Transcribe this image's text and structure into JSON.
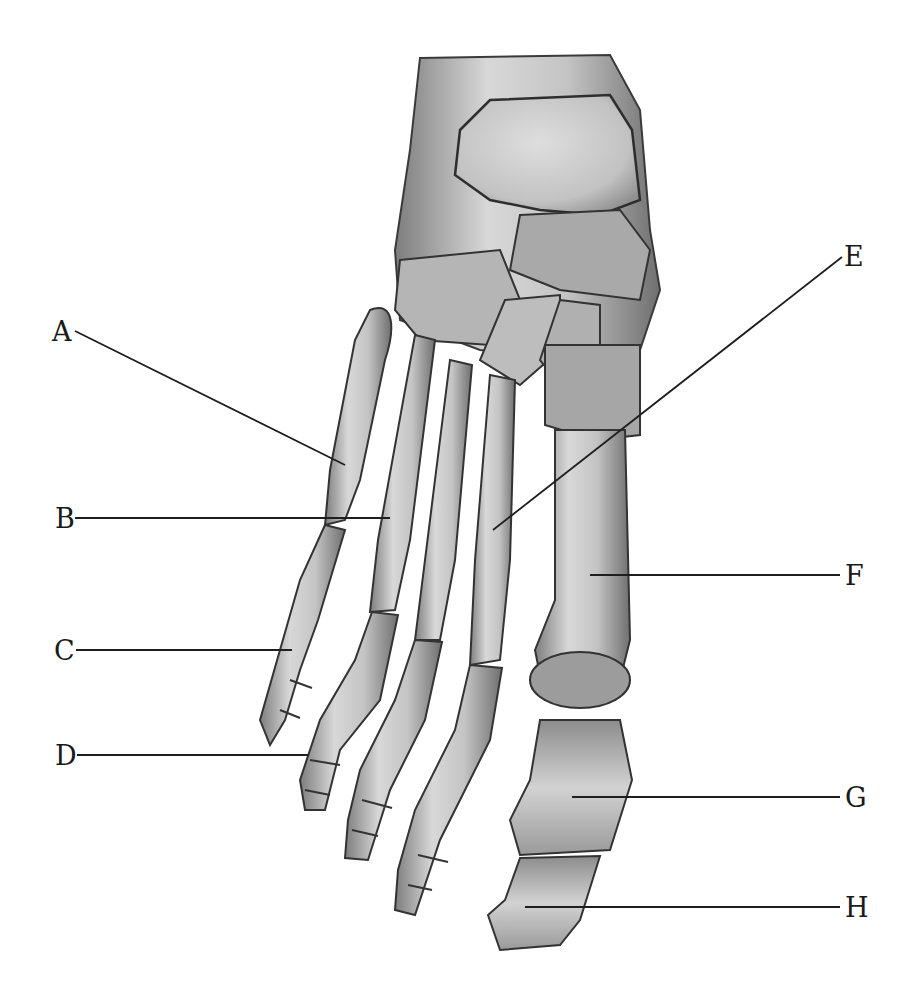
{
  "diagram": {
    "background_color": "#ffffff",
    "bone_color": "#c9c9c9",
    "bone_shade_color": "#8a8a8a",
    "outline_color": "#3a3a3a",
    "leader_line_color": "#1e1e1e",
    "labels": [
      {
        "id": "A",
        "text": "A",
        "x": 52,
        "y": 320,
        "line": [
          75,
          331,
          345,
          465
        ]
      },
      {
        "id": "B",
        "text": "B",
        "x": 55,
        "y": 506,
        "line": [
          75,
          518,
          390,
          518
        ]
      },
      {
        "id": "C",
        "text": "C",
        "x": 54,
        "y": 638,
        "line": [
          76,
          650,
          292,
          650
        ]
      },
      {
        "id": "D",
        "text": "D",
        "x": 55,
        "y": 743,
        "line": [
          77,
          755,
          308,
          755
        ]
      },
      {
        "id": "E",
        "text": "E",
        "x": 845,
        "y": 243,
        "line": [
          842,
          257,
          493,
          530
        ]
      },
      {
        "id": "F",
        "text": "F",
        "x": 845,
        "y": 563,
        "line": [
          590,
          575,
          840,
          575
        ]
      },
      {
        "id": "G",
        "text": "G",
        "x": 845,
        "y": 785,
        "line": [
          572,
          797,
          840,
          797
        ]
      },
      {
        "id": "H",
        "text": "H",
        "x": 845,
        "y": 895,
        "line": [
          525,
          907,
          840,
          907
        ]
      }
    ]
  }
}
